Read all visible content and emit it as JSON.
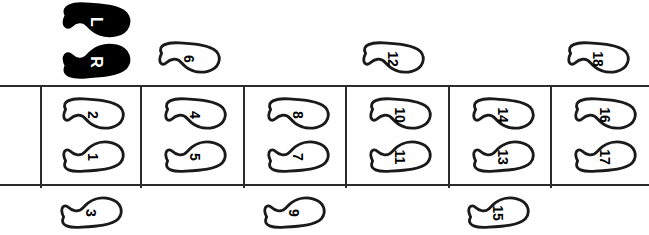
{
  "diagram": {
    "colors": {
      "line": "#1a1a1a",
      "fill": "#ffffff",
      "solid": "#000000",
      "background": "#ffffff"
    }
  },
  "legend": {
    "left_label": "L",
    "right_label": "R"
  },
  "band": {
    "cell_count": 6,
    "dividers_x": [
      40,
      140,
      243,
      345,
      448,
      550
    ]
  },
  "footprints": [
    {
      "label": "L",
      "foot": "left",
      "style": "solid",
      "x": 57,
      "y": 3,
      "row": "legend-upper"
    },
    {
      "label": "R",
      "foot": "right",
      "style": "solid",
      "x": 57,
      "y": 43,
      "row": "legend-lower"
    },
    {
      "label": "6",
      "foot": "left",
      "style": "outline",
      "x": 153,
      "y": 42,
      "row": "above-band"
    },
    {
      "label": "12",
      "foot": "left",
      "style": "outline",
      "x": 357,
      "y": 42,
      "row": "above-band"
    },
    {
      "label": "18",
      "foot": "left",
      "style": "outline",
      "x": 562,
      "y": 42,
      "row": "above-band"
    },
    {
      "label": "2",
      "foot": "left",
      "style": "outline",
      "x": 57,
      "y": 98,
      "row": "cell-1-upper"
    },
    {
      "label": "1",
      "foot": "right",
      "style": "outline",
      "x": 57,
      "y": 140,
      "row": "cell-1-lower"
    },
    {
      "label": "4",
      "foot": "left",
      "style": "outline",
      "x": 159,
      "y": 98,
      "row": "cell-2-upper"
    },
    {
      "label": "5",
      "foot": "right",
      "style": "outline",
      "x": 159,
      "y": 140,
      "row": "cell-2-lower"
    },
    {
      "label": "8",
      "foot": "left",
      "style": "outline",
      "x": 262,
      "y": 98,
      "row": "cell-3-upper"
    },
    {
      "label": "7",
      "foot": "right",
      "style": "outline",
      "x": 262,
      "y": 140,
      "row": "cell-3-lower"
    },
    {
      "label": "10",
      "foot": "left",
      "style": "outline",
      "x": 364,
      "y": 98,
      "row": "cell-4-upper"
    },
    {
      "label": "11",
      "foot": "right",
      "style": "outline",
      "x": 364,
      "y": 140,
      "row": "cell-4-lower"
    },
    {
      "label": "14",
      "foot": "left",
      "style": "outline",
      "x": 467,
      "y": 98,
      "row": "cell-5-upper"
    },
    {
      "label": "13",
      "foot": "right",
      "style": "outline",
      "x": 467,
      "y": 140,
      "row": "cell-5-lower"
    },
    {
      "label": "16",
      "foot": "left",
      "style": "outline",
      "x": 569,
      "y": 98,
      "row": "cell-6-upper"
    },
    {
      "label": "17",
      "foot": "right",
      "style": "outline",
      "x": 569,
      "y": 140,
      "row": "cell-6-lower"
    },
    {
      "label": "3",
      "foot": "right",
      "style": "outline",
      "x": 55,
      "y": 196,
      "row": "below-band"
    },
    {
      "label": "9",
      "foot": "right",
      "style": "outline",
      "x": 258,
      "y": 196,
      "row": "below-band"
    },
    {
      "label": "15",
      "foot": "right",
      "style": "outline",
      "x": 462,
      "y": 196,
      "row": "below-band"
    }
  ]
}
